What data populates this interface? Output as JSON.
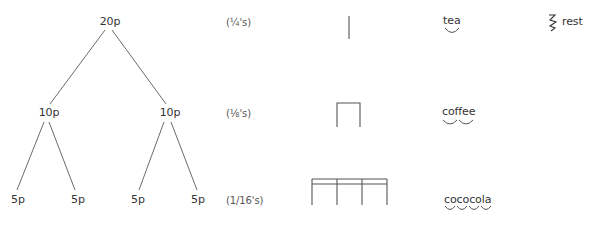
{
  "tree": {
    "root": {
      "label": "20p",
      "x": 110,
      "y": 16
    },
    "level1": [
      {
        "label": "10p",
        "x": 49,
        "y": 107
      },
      {
        "label": "10p",
        "x": 170,
        "y": 107
      }
    ],
    "level2": [
      {
        "label": "5p",
        "x": 18,
        "y": 194
      },
      {
        "label": "5p",
        "x": 78,
        "y": 194
      },
      {
        "label": "5p",
        "x": 138,
        "y": 194
      },
      {
        "label": "5p",
        "x": 198,
        "y": 194
      }
    ]
  },
  "fractions": [
    {
      "label": "(¼'s)",
      "y": 16
    },
    {
      "label": "(⅛'s)",
      "y": 107
    },
    {
      "label": "(1/16's)",
      "num": "1",
      "den": "16",
      "y": 194
    }
  ],
  "rhythm_words": [
    {
      "label": "tea",
      "syllables": 1,
      "y": 15
    },
    {
      "label": "coffee",
      "syllables": 2,
      "y": 106
    },
    {
      "label": "cococola",
      "syllables": 4,
      "y": 194
    }
  ],
  "rest": {
    "label": "rest",
    "symbol": "crotchet-rest-icon"
  },
  "colors": {
    "ink": "#333333",
    "line": "#5a5a5a",
    "background": "#ffffff"
  }
}
